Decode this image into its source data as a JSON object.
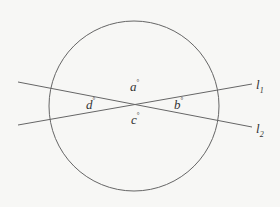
{
  "diagram": {
    "colors": {
      "background": "#f7f7f5",
      "stroke": "#666666",
      "text": "#333333"
    },
    "circle": {
      "cx": 134,
      "cy": 106,
      "r": 85
    },
    "lines": [
      {
        "name": "l1",
        "x1": 18,
        "y1": 125,
        "x2": 252,
        "y2": 84
      },
      {
        "name": "l2",
        "x1": 18,
        "y1": 82,
        "x2": 252,
        "y2": 127
      }
    ],
    "angle_labels": {
      "a": {
        "letter": "a",
        "degree": "°"
      },
      "b": {
        "letter": "b",
        "degree": "°"
      },
      "c": {
        "letter": "c",
        "degree": "°"
      },
      "d": {
        "letter": "d",
        "degree": "°"
      }
    },
    "line_labels": {
      "l1": {
        "letter": "l",
        "sub": "1"
      },
      "l2": {
        "letter": "l",
        "sub": "2"
      }
    }
  }
}
